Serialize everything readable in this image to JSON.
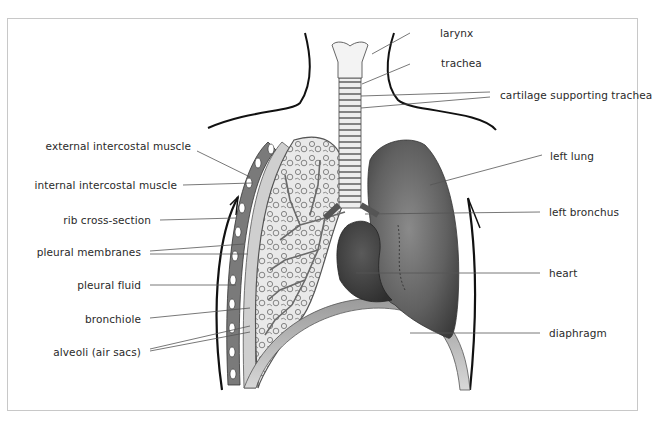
{
  "diagram": {
    "title": "",
    "labels_left": [
      {
        "id": "external-intercostal-muscle",
        "text": "external intercostal muscle"
      },
      {
        "id": "internal-intercostal-muscle",
        "text": "internal intercostal muscle"
      },
      {
        "id": "rib-cross-section",
        "text": "rib cross-section"
      },
      {
        "id": "pleural-membranes",
        "text": "pleural membranes"
      },
      {
        "id": "pleural-fluid",
        "text": "pleural fluid"
      },
      {
        "id": "bronchiole",
        "text": "bronchiole"
      },
      {
        "id": "alveoli",
        "text": "alveoli (air sacs)"
      }
    ],
    "labels_right": [
      {
        "id": "larynx",
        "text": "larynx"
      },
      {
        "id": "trachea",
        "text": "trachea"
      },
      {
        "id": "cartilage-supporting-trachea",
        "text": "cartilage supporting trachea"
      },
      {
        "id": "left-lung",
        "text": "left lung"
      },
      {
        "id": "left-bronchus",
        "text": "left bronchus"
      },
      {
        "id": "heart",
        "text": "heart"
      },
      {
        "id": "diaphragm",
        "text": "diaphragm"
      }
    ],
    "colors": {
      "frame": "#c8c8c8",
      "leader_line": "#555555",
      "lung_left_fill": "#5f5f5f",
      "lung_cut_fill": "#e6e6e6",
      "heart_fill": "#3f3f3f",
      "body_outline": "#111111"
    }
  }
}
